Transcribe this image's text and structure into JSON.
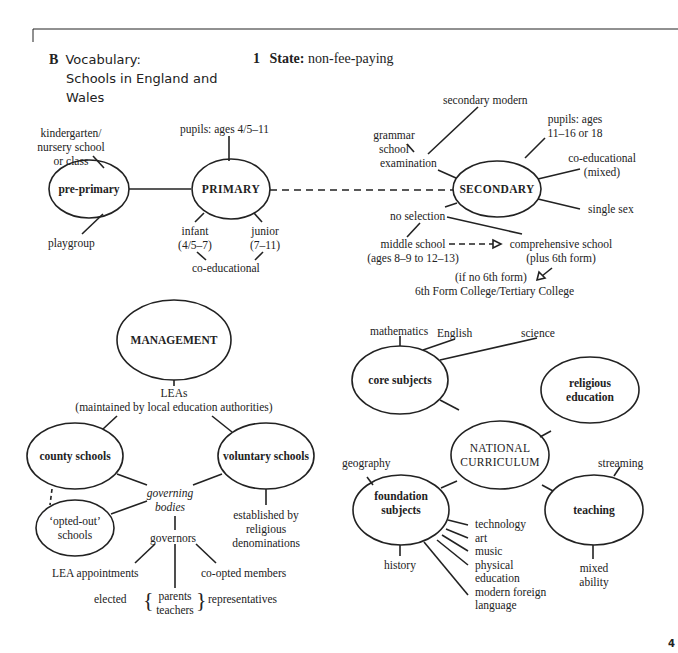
{
  "header": {
    "section_letter": "B",
    "title_line1": "Vocabulary:",
    "title_line2": "Schools in England and",
    "title_line3": "Wales",
    "subsection_number": "1",
    "subsection_label": "State:",
    "subsection_text": "non-fee-paying"
  },
  "state": {
    "nodes": {
      "pre_primary": "pre-primary",
      "primary": "PRIMARY",
      "secondary": "SECONDARY"
    },
    "pre_primary": {
      "kindergarten_l1": "kindergarten/",
      "kindergarten_l2": "nursery school",
      "kindergarten_l3": "or class",
      "playgroup": "playgroup"
    },
    "primary": {
      "pupils": "pupils: ages 4/5–11",
      "infant_l1": "infant",
      "infant_l2": "(4/5–7)",
      "junior_l1": "junior",
      "junior_l2": "(7–11)",
      "coed": "co-educational"
    },
    "secondary": {
      "secondary_modern": "secondary modern",
      "grammar_l1": "grammar",
      "grammar_l2": "school",
      "examination": "examination",
      "pupils_l1": "pupils: ages",
      "pupils_l2": "11–16 or 18",
      "coed_l1": "co-educational",
      "coed_l2": "(mixed)",
      "single_sex": "single sex",
      "no_selection": "no selection",
      "middle_l1": "middle school",
      "middle_l2": "(ages 8–9 to 12–13)",
      "comprehensive_l1": "comprehensive school",
      "comprehensive_l2": "(plus 6th form)",
      "no_sixth": "(if no 6th form)",
      "sixth_form_college": "6th Form College/Tertiary College"
    }
  },
  "management": {
    "node": "MANAGEMENT",
    "leas": "LEAs",
    "leas_desc": "(maintained by local education authorities)",
    "county": "county schools",
    "voluntary": "voluntary schools",
    "governing_l1": "governing",
    "governing_l2": "bodies",
    "opted_out_l1": "‘opted-out’",
    "opted_out_l2": "schools",
    "established_l1": "established by",
    "established_l2": "religious",
    "established_l3": "denominations",
    "governors": "governors",
    "lea_appointments": "LEA appointments",
    "co_opted": "co-opted members",
    "elected": "elected",
    "parents": "parents",
    "teachers": "teachers",
    "representatives": "representatives"
  },
  "curriculum": {
    "node_l1": "NATIONAL",
    "node_l2": "CURRICULUM",
    "core": "core subjects",
    "religious_l1": "religious",
    "religious_l2": "education",
    "foundation_l1": "foundation",
    "foundation_l2": "subjects",
    "teaching": "teaching",
    "english": "English",
    "science": "science",
    "mathematics": "mathematics",
    "geography": "geography",
    "history": "history",
    "technology": "technology",
    "art": "art",
    "music": "music",
    "physical_l1": "physical",
    "physical_l2": "education",
    "mfl_l1": "modern foreign",
    "mfl_l2": "language",
    "streaming": "streaming",
    "mixed_l1": "mixed",
    "mixed_l2": "ability"
  },
  "page_number": "4"
}
